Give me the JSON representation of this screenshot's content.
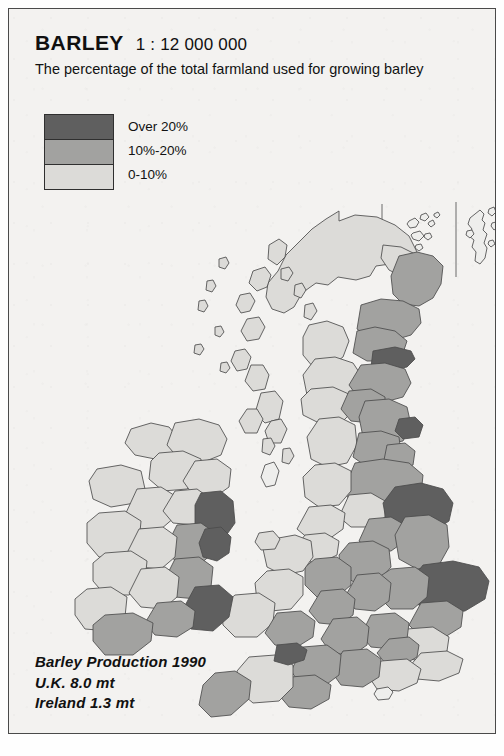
{
  "header": {
    "title": "BARLEY",
    "scale": "1 : 12 000 000",
    "subtitle": "The percentage of the total farmland used for growing barley"
  },
  "legend": {
    "items": [
      {
        "label": "Over 20%",
        "color": "#5f5f5f",
        "level": 2
      },
      {
        "label": "10%-20%",
        "color": "#a2a2a0",
        "level": 1
      },
      {
        "label": "0-10%",
        "color": "#dcdbd8",
        "level": 0
      }
    ]
  },
  "footer": {
    "line1": "Barley Production 1990",
    "line2": "U.K. 8.0 mt",
    "line3": "Ireland 1.3 mt"
  },
  "colors": {
    "paper": "#f3f2f0",
    "frame": "#4a4a4a",
    "outline": "#4b4b4b",
    "level_over20": "#5f5f5f",
    "level_10_20": "#a2a2a0",
    "level_0_10": "#dcdbd8",
    "unclassified": "#eeeeec"
  },
  "map": {
    "projection_note": "British Isles choropleth, counties / regions",
    "insets": [
      "Orkney",
      "Shetland"
    ],
    "regions_over20": [
      "East Lothian / Borders (Scotland)",
      "North Yorkshire coast",
      "Humberside / East Riding",
      "Norfolk",
      "South Glamorgan (Wales)",
      "Louth / Dublin (Ireland)",
      "Wexford (Ireland)"
    ]
  }
}
